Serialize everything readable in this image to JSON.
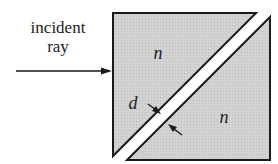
{
  "diagram": {
    "title_label_line1": "incident",
    "title_label_line2": "ray",
    "upper_prism_label": "n",
    "lower_prism_label": "n",
    "gap_label": "d",
    "colors": {
      "prism_fill": "#cfcfcf",
      "outline": "#1a1a1a",
      "gap": "#ffffff",
      "text": "#222222"
    }
  }
}
